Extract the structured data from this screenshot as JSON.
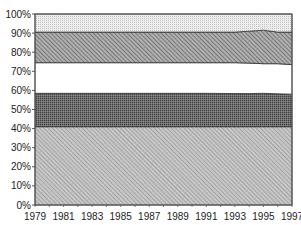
{
  "chart_data": {
    "type": "area",
    "stacked": true,
    "normalized": true,
    "title": "",
    "xlabel": "",
    "ylabel": "",
    "ylim": [
      0,
      100
    ],
    "yticks": [
      "0%",
      "10%",
      "20%",
      "30%",
      "40%",
      "50%",
      "60%",
      "70%",
      "80%",
      "90%",
      "100%"
    ],
    "xticks": [
      "1979",
      "1981",
      "1983",
      "1985",
      "1987",
      "1989",
      "1991",
      "1993",
      "1995",
      "1997"
    ],
    "x": [
      1979,
      1981,
      1983,
      1985,
      1987,
      1989,
      1991,
      1993,
      1994,
      1995,
      1996,
      1997
    ],
    "grid": false,
    "legend": null,
    "series": [
      {
        "name": "Series 1 (bottom, diagonal hatch)",
        "pattern": "hatch-light",
        "values": [
          41,
          41,
          41,
          41,
          41,
          41,
          41,
          41,
          41,
          41,
          41,
          41
        ]
      },
      {
        "name": "Series 2 (dark dotted)",
        "pattern": "dots-dark",
        "values": [
          17.5,
          17.5,
          17.5,
          17.5,
          17.5,
          17.5,
          17.5,
          17.3,
          17.3,
          17.5,
          17.2,
          17
        ]
      },
      {
        "name": "Series 3 (white)",
        "pattern": "white",
        "values": [
          16,
          16,
          16,
          16,
          16,
          16,
          16,
          16.2,
          16,
          15.5,
          15.8,
          15.5
        ]
      },
      {
        "name": "Series 4 (dense hatch)",
        "pattern": "hatch-dark",
        "values": [
          16,
          16,
          16,
          16,
          16,
          16,
          16,
          16,
          16.7,
          17.5,
          16.5,
          17
        ]
      },
      {
        "name": "Series 5 (top, light dotted)",
        "pattern": "dots-light",
        "values": [
          9.5,
          9.5,
          9.5,
          9.5,
          9.5,
          9.5,
          9.5,
          9.5,
          9,
          8.5,
          9.5,
          9.5
        ]
      }
    ]
  }
}
